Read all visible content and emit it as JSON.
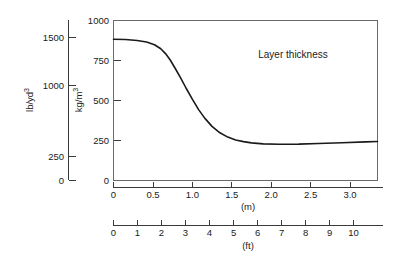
{
  "chart_data": {
    "type": "line",
    "title": "",
    "annotation": "Layer thickness",
    "xlabel_primary": "(m)",
    "xlabel_secondary": "(ft)",
    "ylabel_primary": "kg/m3",
    "ylabel_secondary": "lb/yd3",
    "ylabel_primary_parts": {
      "base": "kg/m",
      "exponent": "3"
    },
    "ylabel_secondary_parts": {
      "base": "lb/yd",
      "exponent": "3"
    },
    "grid": false,
    "legend": "none",
    "x_primary": {
      "unit": "m",
      "min": 0,
      "max": 3.35,
      "ticks": [
        0,
        0.5,
        1.0,
        1.5,
        2.0,
        2.5,
        3.0
      ],
      "tick_labels": [
        "0",
        "0.5",
        "1.0",
        "1.5",
        "2.0",
        "2.5",
        "3.0"
      ]
    },
    "x_secondary": {
      "unit": "ft",
      "min": 0,
      "max": 11,
      "ticks": [
        0,
        1,
        2,
        3,
        4,
        5,
        6,
        7,
        8,
        9,
        10
      ],
      "tick_labels": [
        "0",
        "1",
        "2",
        "3",
        "4",
        "5",
        "6",
        "7",
        "8",
        "9",
        "10"
      ]
    },
    "y_primary": {
      "unit": "kg/m3",
      "min": 0,
      "max": 1000,
      "ticks": [
        0,
        250,
        500,
        750,
        1000
      ],
      "tick_labels": [
        "0",
        "250",
        "500",
        "750",
        "1000"
      ]
    },
    "y_secondary": {
      "unit": "lb/yd3",
      "min": 0,
      "max": 1686,
      "ticks": [
        0,
        250,
        1000,
        1500
      ],
      "tick_labels": [
        "0",
        "250",
        "1000",
        "1500"
      ]
    },
    "series": [
      {
        "name": "Layer thickness",
        "x": [
          0.0,
          0.15,
          0.3,
          0.42,
          0.52,
          0.6,
          0.66,
          0.72,
          0.78,
          0.85,
          0.92,
          1.0,
          1.08,
          1.16,
          1.25,
          1.35,
          1.45,
          1.55,
          1.65,
          1.75,
          1.9,
          2.1,
          2.35,
          2.6,
          2.9,
          3.2,
          3.35
        ],
        "y": [
          880,
          878,
          872,
          862,
          845,
          820,
          790,
          750,
          700,
          640,
          575,
          505,
          440,
          385,
          335,
          295,
          268,
          250,
          240,
          232,
          226,
          223,
          224,
          228,
          233,
          238,
          241
        ]
      }
    ]
  }
}
